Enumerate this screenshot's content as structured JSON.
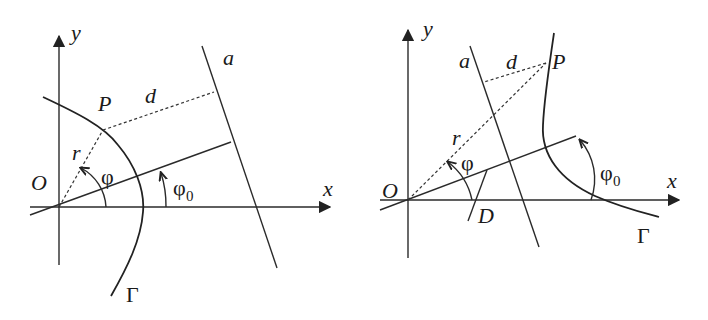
{
  "figure": {
    "left_panel": {
      "labels": {
        "y_axis": "y",
        "x_axis": "x",
        "origin": "O",
        "point": "P",
        "distance": "d",
        "radius": "r",
        "angle": "φ",
        "angle0": "φ",
        "angle0_sub": "0",
        "line": "a",
        "curve": "Γ"
      },
      "description": "Ellipse-like conic branch Γ with focus O, directrix a, polar angle φ and axis angle φ0"
    },
    "right_panel": {
      "labels": {
        "y_axis": "y",
        "x_axis": "x",
        "origin": "O",
        "point": "P",
        "distance": "d",
        "radius": "r",
        "angle": "φ",
        "angle0": "φ",
        "angle0_sub": "0",
        "line": "a",
        "curve": "Γ",
        "foot": "D"
      },
      "description": "Hyperbola branch Γ with focus O, directrix a, point D on the axis, polar angle φ and axis angle φ0"
    },
    "colors": {
      "ink": "#222222",
      "background": "#ffffff"
    }
  }
}
